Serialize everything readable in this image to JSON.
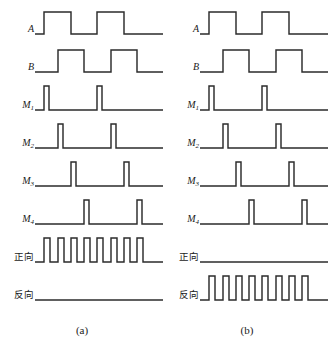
{
  "figure": {
    "type": "quadrature-encoder-timing-diagram",
    "background_color": "#ffffff",
    "line_color": "#2b2b2b",
    "panel_count": 2
  },
  "panels": [
    {
      "id": "a",
      "caption": "(a)",
      "direction": "forward",
      "rows": [
        {
          "label": "A",
          "label_script": "latin",
          "kind": "square",
          "description": "channel A square wave, leads channel B by 90 degrees",
          "segments": [
            {
              "x": 0,
              "level": 0
            },
            {
              "x": 9,
              "level": 1
            },
            {
              "x": 36,
              "level": 0
            },
            {
              "x": 62,
              "level": 1
            },
            {
              "x": 89,
              "level": 0
            },
            {
              "x": 128,
              "level": 0
            }
          ]
        },
        {
          "label": "B",
          "label_script": "latin",
          "kind": "square",
          "description": "channel B square wave, lags channel A by 90 degrees",
          "segments": [
            {
              "x": 0,
              "level": 0
            },
            {
              "x": 23,
              "level": 1
            },
            {
              "x": 49,
              "level": 0
            },
            {
              "x": 76,
              "level": 1
            },
            {
              "x": 102,
              "level": 0
            },
            {
              "x": 128,
              "level": 0
            }
          ]
        },
        {
          "label": "M",
          "label_sub": "1",
          "label_script": "latin",
          "kind": "pulses",
          "description": "pulse on each rising edge of A",
          "pulse_x": [
            9,
            62
          ],
          "pulse_width": 5
        },
        {
          "label": "M",
          "label_sub": "2",
          "label_script": "latin",
          "kind": "pulses",
          "description": "pulse on each rising edge of B",
          "pulse_x": [
            23,
            76
          ],
          "pulse_width": 5
        },
        {
          "label": "M",
          "label_sub": "3",
          "label_script": "latin",
          "kind": "pulses",
          "description": "pulse on each falling edge of A",
          "pulse_x": [
            36,
            89
          ],
          "pulse_width": 5
        },
        {
          "label": "M",
          "label_sub": "4",
          "label_script": "latin",
          "kind": "pulses",
          "description": "pulse on each falling edge of B",
          "pulse_x": [
            49,
            102
          ],
          "pulse_width": 5
        },
        {
          "label": "正向",
          "label_script": "cjk",
          "kind": "pulse-train",
          "description": "forward direction output, eight counting pulses",
          "pulse_count": 8,
          "pulse_x": [
            9,
            23,
            36,
            49,
            62,
            76,
            89,
            102
          ],
          "pulse_width": 6
        },
        {
          "label": "反向",
          "label_script": "cjk",
          "kind": "flat",
          "description": "reverse direction output stays low",
          "pulse_count": 0,
          "pulse_x": [],
          "pulse_width": 6
        }
      ]
    },
    {
      "id": "b",
      "caption": "(b)",
      "direction": "reverse",
      "rows": [
        {
          "label": "A",
          "label_script": "latin",
          "kind": "square",
          "description": "channel A square wave",
          "segments": [
            {
              "x": 0,
              "level": 0
            },
            {
              "x": 9,
              "level": 1
            },
            {
              "x": 36,
              "level": 0
            },
            {
              "x": 62,
              "level": 1
            },
            {
              "x": 89,
              "level": 0
            },
            {
              "x": 128,
              "level": 0
            }
          ]
        },
        {
          "label": "B",
          "label_script": "latin",
          "kind": "square",
          "description": "channel B square wave",
          "segments": [
            {
              "x": 0,
              "level": 0
            },
            {
              "x": 23,
              "level": 1
            },
            {
              "x": 49,
              "level": 0
            },
            {
              "x": 76,
              "level": 1
            },
            {
              "x": 102,
              "level": 0
            },
            {
              "x": 128,
              "level": 0
            }
          ]
        },
        {
          "label": "M",
          "label_sub": "1",
          "label_script": "latin",
          "kind": "pulses",
          "description": "pulse on each rising edge of A",
          "pulse_x": [
            9,
            62
          ],
          "pulse_width": 5
        },
        {
          "label": "M",
          "label_sub": "2",
          "label_script": "latin",
          "kind": "pulses",
          "description": "pulse on each rising edge of B",
          "pulse_x": [
            23,
            76
          ],
          "pulse_width": 5
        },
        {
          "label": "M",
          "label_sub": "3",
          "label_script": "latin",
          "kind": "pulses",
          "description": "pulse on each falling edge of A",
          "pulse_x": [
            36,
            89
          ],
          "pulse_width": 5
        },
        {
          "label": "M",
          "label_sub": "4",
          "label_script": "latin",
          "kind": "pulses",
          "description": "pulse on each falling edge of B",
          "pulse_x": [
            49,
            102
          ],
          "pulse_width": 5
        },
        {
          "label": "正向",
          "label_script": "cjk",
          "kind": "flat",
          "description": "forward direction output stays low",
          "pulse_count": 0,
          "pulse_x": [],
          "pulse_width": 6
        },
        {
          "label": "反向",
          "label_script": "cjk",
          "kind": "pulse-train",
          "description": "reverse direction output, eight counting pulses",
          "pulse_count": 8,
          "pulse_x": [
            9,
            23,
            36,
            49,
            62,
            76,
            89,
            102
          ],
          "pulse_width": 6
        }
      ]
    }
  ],
  "geometry": {
    "row_tops": [
      4,
      42,
      80,
      118,
      156,
      194,
      232,
      270
    ],
    "row_height": 38,
    "baseline_y": 30,
    "high_y": 8,
    "pulse_high_y": 6,
    "caption_y": 324
  }
}
